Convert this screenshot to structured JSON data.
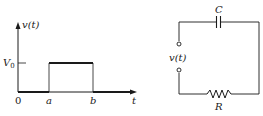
{
  "pulse_plot": {
    "y_axis_label": "v(t)",
    "x_axis_label": "t",
    "level_label_main": "V",
    "level_label_sub": "0",
    "origin_label": "0",
    "start_label": "a",
    "end_label": "b",
    "description": "Rectangular pulse of amplitude V0 from t=a to t=b"
  },
  "circuit": {
    "capacitor_label": "C",
    "resistor_label": "R",
    "source_label": "v(t)",
    "description": "Series RC circuit driven by voltage v(t)"
  },
  "colors": {
    "ink": "#1a1a1a",
    "background": "#ffffff"
  }
}
